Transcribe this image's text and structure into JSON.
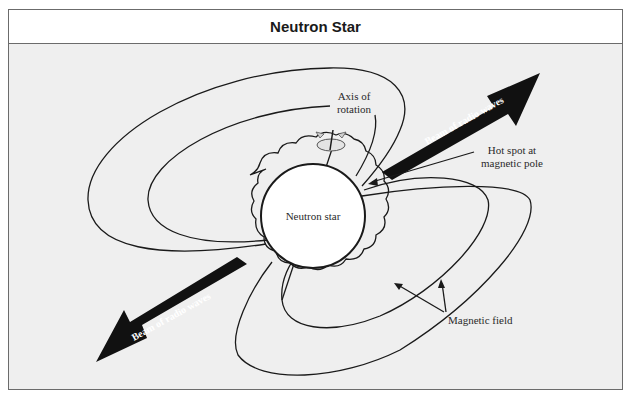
{
  "header": {
    "title": "Neutron Star"
  },
  "diagram": {
    "star_label": "Neutron star",
    "axis_label_line1": "Axis of",
    "axis_label_line2": "rotation",
    "beam_upper_label": "Beam of radio waves",
    "beam_lower_label": "Beam of radio waves",
    "hotspot_label_line1": "Hot spot at",
    "hotspot_label_line2": "magnetic pole",
    "field_label": "Magnetic field",
    "icons": {
      "rotation": "rotation-arrow-icon",
      "beam": "beam-arrow-icon"
    },
    "colors": {
      "background": "#efefef",
      "star_fill": "#ffffff",
      "beam_fill": "#111111",
      "frame_border": "#6b6b6b"
    }
  }
}
